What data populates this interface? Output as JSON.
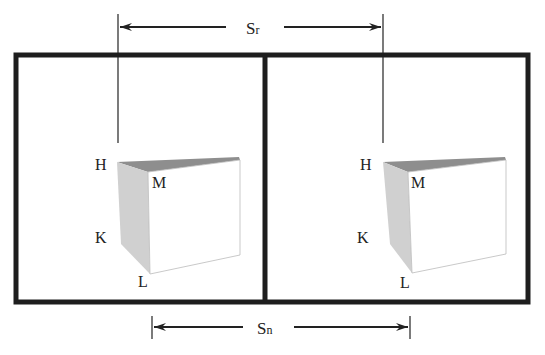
{
  "diagram": {
    "top_dimension": {
      "label_main": "S",
      "label_sub": "r",
      "x1": 118,
      "x2": 383,
      "y": 27
    },
    "bottom_dimension": {
      "label_main": "S",
      "label_sub": "n",
      "x1": 152,
      "x2": 410,
      "y": 327
    },
    "colors": {
      "frame": "#1e1e1e",
      "line": "#2a2a2a",
      "side_face": "#cfcfcf",
      "top_face": "#8e8e8e",
      "front_face": "#ffffff",
      "text": "#222222"
    },
    "panels": [
      {
        "name": "left",
        "labels": {
          "H": "H",
          "M": "M",
          "K": "K",
          "L": "L"
        }
      },
      {
        "name": "right",
        "labels": {
          "H": "H",
          "M": "M",
          "K": "K",
          "L": "L"
        }
      }
    ]
  }
}
